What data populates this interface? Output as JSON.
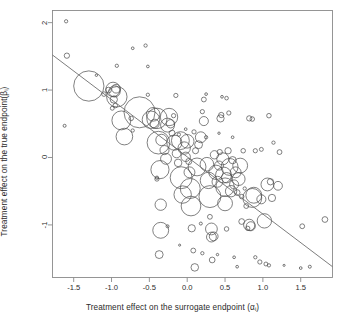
{
  "figure": {
    "background": "#ffffff",
    "frame_color": "#8a8a8a",
    "bubble_color": "#4a4a4a",
    "line_color": "#6e6e6e"
  },
  "axes": {
    "x_title_prefix": "Treatment effect on the surrogate endpoint (",
    "x_title_symbol": "α",
    "x_title_sub": "i",
    "x_title_suffix": ")",
    "x_title_full": "Treatment effect on the surrogate endpoint (αi)",
    "y_title_prefix": "Treatment effect on the true endpoint(",
    "y_title_symbol": "β",
    "y_title_sub": "i",
    "y_title_suffix": ")",
    "y_title_full": "Treatment effect on the true endpoint(βi)",
    "x_ticks": [
      "-1.5",
      "-1.0",
      "-0.5",
      "0.0",
      "0.5",
      "1.0",
      "1.5"
    ],
    "y_ticks": [
      "-1",
      "0",
      "1",
      "2"
    ]
  },
  "chart_data": {
    "type": "scatter",
    "title": "",
    "subtitle": "",
    "xlabel": "Treatment effect on the surrogate endpoint (αi)",
    "ylabel": "Treatment effect on the true endpoint(βi)",
    "xlim": [
      -1.78,
      1.92
    ],
    "ylim": [
      -1.78,
      2.18
    ],
    "xticks": [
      -1.5,
      -1.0,
      -0.5,
      0.0,
      0.5,
      1.0,
      1.5
    ],
    "yticks": [
      -1,
      0,
      1,
      2
    ],
    "grid": false,
    "legend": "none",
    "marker": "open-circle",
    "size_encodes": "study-weight",
    "regression_line": {
      "type": "line",
      "x": [
        -1.78,
        1.92
      ],
      "y": [
        1.52,
        -1.62
      ],
      "slope": -0.849,
      "intercept": 0.0085
    },
    "note": "Bubble area proportional to study precision/weight; x,y in log-scale treatment effects; r is the marker radius in data-units of the x axis",
    "points": [
      {
        "x": -1.6,
        "y": 2.02,
        "r": 0.022
      },
      {
        "x": -1.59,
        "y": 1.51,
        "r": 0.035
      },
      {
        "x": -1.62,
        "y": 0.47,
        "r": 0.02
      },
      {
        "x": -1.3,
        "y": 1.06,
        "r": 0.2
      },
      {
        "x": -1.1,
        "y": 0.94,
        "r": 0.03
      },
      {
        "x": -1.04,
        "y": 1.0,
        "r": 0.038
      },
      {
        "x": -0.98,
        "y": 1.01,
        "r": 0.095
      },
      {
        "x": -0.96,
        "y": 0.98,
        "r": 0.075
      },
      {
        "x": -0.94,
        "y": 1.02,
        "r": 0.058
      },
      {
        "x": -0.93,
        "y": 0.9,
        "r": 0.135
      },
      {
        "x": -0.97,
        "y": 0.86,
        "r": 0.048
      },
      {
        "x": -0.95,
        "y": 0.77,
        "r": 0.03
      },
      {
        "x": -0.99,
        "y": 0.73,
        "r": 0.026
      },
      {
        "x": -0.93,
        "y": 1.36,
        "r": 0.022
      },
      {
        "x": -0.87,
        "y": 0.55,
        "r": 0.125
      },
      {
        "x": -0.83,
        "y": 0.31,
        "r": 0.11
      },
      {
        "x": -0.74,
        "y": 0.58,
        "r": 0.03
      },
      {
        "x": -0.72,
        "y": 0.4,
        "r": 0.022
      },
      {
        "x": -0.63,
        "y": 0.67,
        "r": 0.205
      },
      {
        "x": -0.55,
        "y": 1.66,
        "r": 0.022
      },
      {
        "x": -0.52,
        "y": 0.93,
        "r": 0.022
      },
      {
        "x": -0.48,
        "y": 0.56,
        "r": 0.115
      },
      {
        "x": -0.45,
        "y": 0.64,
        "r": 0.09
      },
      {
        "x": -0.43,
        "y": 0.5,
        "r": 0.06
      },
      {
        "x": -0.4,
        "y": 0.58,
        "r": 0.135
      },
      {
        "x": -0.4,
        "y": -0.32,
        "r": 0.028
      },
      {
        "x": -0.4,
        "y": -0.3,
        "r": 0.022
      },
      {
        "x": -0.38,
        "y": 0.22,
        "r": 0.15
      },
      {
        "x": -0.36,
        "y": -0.18,
        "r": 0.12
      },
      {
        "x": -0.35,
        "y": -0.7,
        "r": 0.075
      },
      {
        "x": -0.35,
        "y": -1.08,
        "r": 0.105
      },
      {
        "x": -0.37,
        "y": -1.44,
        "r": 0.052
      },
      {
        "x": -0.34,
        "y": 0.26,
        "r": 0.075
      },
      {
        "x": -0.3,
        "y": 0.11,
        "r": 0.06
      },
      {
        "x": -0.28,
        "y": -0.02,
        "r": 0.072
      },
      {
        "x": -0.26,
        "y": 0.48,
        "r": 0.092
      },
      {
        "x": -0.24,
        "y": 0.6,
        "r": 0.115
      },
      {
        "x": -0.22,
        "y": 0.5,
        "r": 0.055
      },
      {
        "x": -0.2,
        "y": 0.36,
        "r": 0.04
      },
      {
        "x": -0.18,
        "y": 0.62,
        "r": 0.028
      },
      {
        "x": -0.17,
        "y": 0.22,
        "r": 0.1
      },
      {
        "x": -0.15,
        "y": 0.92,
        "r": 0.028
      },
      {
        "x": -0.14,
        "y": 0.06,
        "r": 0.058
      },
      {
        "x": -0.12,
        "y": -0.08,
        "r": 0.05
      },
      {
        "x": -0.11,
        "y": 0.34,
        "r": 0.022
      },
      {
        "x": -0.09,
        "y": 0.25,
        "r": 0.118
      },
      {
        "x": -0.08,
        "y": -0.3,
        "r": 0.145
      },
      {
        "x": -0.06,
        "y": -0.55,
        "r": 0.115
      },
      {
        "x": -0.04,
        "y": 0.14,
        "r": 0.082
      },
      {
        "x": -0.02,
        "y": 0.01,
        "r": 0.062
      },
      {
        "x": 0.0,
        "y": 0.24,
        "r": 0.09
      },
      {
        "x": 0.02,
        "y": -0.06,
        "r": 0.04
      },
      {
        "x": 0.03,
        "y": -0.22,
        "r": 0.072
      },
      {
        "x": 0.04,
        "y": -0.46,
        "r": 0.132
      },
      {
        "x": 0.05,
        "y": -0.72,
        "r": 0.13
      },
      {
        "x": 0.06,
        "y": -1.05,
        "r": 0.048
      },
      {
        "x": 0.08,
        "y": -1.38,
        "r": 0.032
      },
      {
        "x": 0.1,
        "y": -1.63,
        "r": 0.05
      },
      {
        "x": 0.09,
        "y": 0.38,
        "r": 0.028
      },
      {
        "x": 0.11,
        "y": 0.1,
        "r": 0.04
      },
      {
        "x": 0.13,
        "y": -0.14,
        "r": 0.118
      },
      {
        "x": 0.15,
        "y": 0.19,
        "r": 0.052
      },
      {
        "x": 0.18,
        "y": 0.3,
        "r": 0.072
      },
      {
        "x": 0.2,
        "y": 0.68,
        "r": 0.028
      },
      {
        "x": 0.22,
        "y": 0.54,
        "r": 0.06
      },
      {
        "x": 0.22,
        "y": 0.86,
        "r": 0.032
      },
      {
        "x": 0.25,
        "y": 0.3,
        "r": 0.022
      },
      {
        "x": 0.26,
        "y": -0.1,
        "r": 0.09
      },
      {
        "x": 0.28,
        "y": -0.34,
        "r": 0.108
      },
      {
        "x": 0.3,
        "y": -0.58,
        "r": 0.145
      },
      {
        "x": 0.3,
        "y": -0.88,
        "r": 0.032
      },
      {
        "x": 0.32,
        "y": -1.06,
        "r": 0.078
      },
      {
        "x": 0.32,
        "y": -1.18,
        "r": 0.065
      },
      {
        "x": 0.35,
        "y": -1.17,
        "r": 0.058
      },
      {
        "x": 0.33,
        "y": -1.52,
        "r": 0.038
      },
      {
        "x": 0.36,
        "y": 0.04,
        "r": 0.055
      },
      {
        "x": 0.38,
        "y": -0.22,
        "r": 0.095
      },
      {
        "x": 0.4,
        "y": -0.36,
        "r": 0.072
      },
      {
        "x": 0.42,
        "y": -0.12,
        "r": 0.06
      },
      {
        "x": 0.43,
        "y": 0.08,
        "r": 0.035
      },
      {
        "x": 0.44,
        "y": 0.58,
        "r": 0.048
      },
      {
        "x": 0.45,
        "y": 0.63,
        "r": 0.035
      },
      {
        "x": 0.47,
        "y": -0.02,
        "r": 0.08
      },
      {
        "x": 0.48,
        "y": -0.26,
        "r": 0.105
      },
      {
        "x": 0.5,
        "y": -0.44,
        "r": 0.122
      },
      {
        "x": 0.5,
        "y": -0.68,
        "r": 0.098
      },
      {
        "x": 0.52,
        "y": -0.3,
        "r": 0.068
      },
      {
        "x": 0.54,
        "y": 0.1,
        "r": 0.042
      },
      {
        "x": 0.55,
        "y": 0.66,
        "r": 0.028
      },
      {
        "x": 0.56,
        "y": -0.14,
        "r": 0.112
      },
      {
        "x": 0.58,
        "y": -0.5,
        "r": 0.075
      },
      {
        "x": 0.6,
        "y": -0.04,
        "r": 0.048
      },
      {
        "x": 0.62,
        "y": -0.4,
        "r": 0.06
      },
      {
        "x": 0.64,
        "y": -0.22,
        "r": 0.072
      },
      {
        "x": 0.66,
        "y": -0.52,
        "r": 0.038
      },
      {
        "x": 0.68,
        "y": -0.32,
        "r": 0.085
      },
      {
        "x": 0.7,
        "y": -0.12,
        "r": 0.098
      },
      {
        "x": 0.72,
        "y": -0.58,
        "r": 0.03
      },
      {
        "x": 0.72,
        "y": -0.95,
        "r": 0.038
      },
      {
        "x": 0.74,
        "y": 0.1,
        "r": 0.03
      },
      {
        "x": 0.76,
        "y": -0.46,
        "r": 0.022
      },
      {
        "x": 0.78,
        "y": -0.72,
        "r": 0.032
      },
      {
        "x": 0.8,
        "y": -1.05,
        "r": 0.028
      },
      {
        "x": 0.82,
        "y": -1.0,
        "r": 0.075
      },
      {
        "x": 0.84,
        "y": -1.02,
        "r": 0.06
      },
      {
        "x": 0.86,
        "y": -0.6,
        "r": 0.125
      },
      {
        "x": 0.88,
        "y": -0.56,
        "r": 0.105
      },
      {
        "x": 0.82,
        "y": 0.58,
        "r": 0.035
      },
      {
        "x": 0.86,
        "y": 0.57,
        "r": 0.03
      },
      {
        "x": 0.9,
        "y": -1.48,
        "r": 0.022
      },
      {
        "x": 0.96,
        "y": -1.55,
        "r": 0.028
      },
      {
        "x": 0.98,
        "y": -0.62,
        "r": 0.06
      },
      {
        "x": 1.02,
        "y": -0.94,
        "r": 0.095
      },
      {
        "x": 1.06,
        "y": -0.4,
        "r": 0.085
      },
      {
        "x": 1.1,
        "y": -0.36,
        "r": 0.042
      },
      {
        "x": 1.12,
        "y": -0.6,
        "r": 0.048
      },
      {
        "x": 1.08,
        "y": 0.62,
        "r": 0.03
      },
      {
        "x": 1.04,
        "y": -1.58,
        "r": 0.026
      },
      {
        "x": 1.08,
        "y": -1.6,
        "r": 0.022
      },
      {
        "x": 1.14,
        "y": 0.22,
        "r": 0.022
      },
      {
        "x": 1.2,
        "y": -0.42,
        "r": 0.058
      },
      {
        "x": 1.22,
        "y": 0.08,
        "r": 0.032
      },
      {
        "x": 1.5,
        "y": -1.64,
        "r": 0.018
      },
      {
        "x": 1.52,
        "y": -1.02,
        "r": 0.032
      },
      {
        "x": 1.62,
        "y": -1.62,
        "r": 0.02
      },
      {
        "x": 1.82,
        "y": -0.92,
        "r": 0.038
      },
      {
        "x": -0.52,
        "y": 1.35,
        "r": 0.018
      },
      {
        "x": -0.72,
        "y": 1.62,
        "r": 0.018
      },
      {
        "x": -1.2,
        "y": 1.22,
        "r": 0.016
      },
      {
        "x": 0.46,
        "y": 0.9,
        "r": 0.018
      },
      {
        "x": 0.52,
        "y": 0.88,
        "r": 0.024
      },
      {
        "x": 0.6,
        "y": 0.3,
        "r": 0.018
      },
      {
        "x": -0.02,
        "y": 0.42,
        "r": 0.018
      },
      {
        "x": 0.25,
        "y": 0.94,
        "r": 0.018
      },
      {
        "x": 0.9,
        "y": 0.1,
        "r": 0.028
      },
      {
        "x": 0.98,
        "y": 0.12,
        "r": 0.026
      },
      {
        "x": 0.42,
        "y": 0.36,
        "r": 0.016
      },
      {
        "x": 0.18,
        "y": -0.98,
        "r": 0.02
      },
      {
        "x": 0.52,
        "y": -1.06,
        "r": 0.03
      },
      {
        "x": 0.2,
        "y": -1.42,
        "r": 0.022
      },
      {
        "x": -0.26,
        "y": -1.02,
        "r": 0.02
      },
      {
        "x": 0.62,
        "y": -1.48,
        "r": 0.018
      },
      {
        "x": 0.66,
        "y": -1.62,
        "r": 0.018
      },
      {
        "x": 0.4,
        "y": -1.44,
        "r": 0.016
      },
      {
        "x": 1.28,
        "y": -1.6,
        "r": 0.014
      },
      {
        "x": -0.1,
        "y": -1.3,
        "r": 0.014
      }
    ]
  }
}
